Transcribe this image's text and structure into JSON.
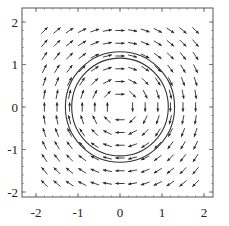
{
  "chart_data": {
    "type": "vector_field",
    "title": "",
    "xlabel": "",
    "ylabel": "",
    "xlim": [
      -2.3,
      2.3
    ],
    "ylim": [
      -2.2,
      2.3
    ],
    "field": {
      "u": "y",
      "v": "-x",
      "normalized": true,
      "rotation": "clockwise"
    },
    "grid": {
      "start": -1.8,
      "stop": 1.8,
      "step": 0.3
    },
    "arrow_length": 0.22,
    "circles": [
      {
        "cx": 0,
        "cy": 0,
        "r": 1.3
      },
      {
        "cx": 0,
        "cy": 0,
        "r": 1.15
      }
    ],
    "x_ticks": [
      {
        "value": -2,
        "label": "-2"
      },
      {
        "value": -1,
        "label": "-1"
      },
      {
        "value": 0,
        "label": "0"
      },
      {
        "value": 1,
        "label": "1"
      },
      {
        "value": 2,
        "label": "2"
      }
    ],
    "y_ticks": [
      {
        "value": 2,
        "label": "2"
      },
      {
        "value": 1,
        "label": "1"
      },
      {
        "value": 0,
        "label": "0"
      },
      {
        "value": -1,
        "label": "-1"
      },
      {
        "value": -2,
        "label": "-2"
      }
    ],
    "colors": {
      "arrow": "#2a2a2a",
      "circle": "#333333",
      "frame": "#555555"
    }
  }
}
